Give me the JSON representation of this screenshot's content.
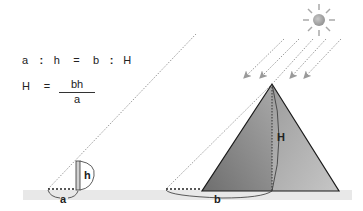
{
  "formulas": {
    "ratio": {
      "a": "a",
      "colon1": ":",
      "h": "h",
      "eq": "=",
      "b": "b",
      "colon2": ":",
      "H": "H"
    },
    "solution": {
      "lhs": "H",
      "eq": "=",
      "numerator": "bh",
      "denominator": "a"
    }
  },
  "labels": {
    "stick_height": "h",
    "stick_shadow": "a",
    "pyramid_height": "H",
    "pyramid_shadow": "b"
  },
  "colors": {
    "ground": "#e6e6e6",
    "pyramid_left_face": "#8a8a8a",
    "pyramid_right_face": "#b5b5b5",
    "sun": "#a0a0a0",
    "rays": "#9a9a9a",
    "ink": "#222222"
  }
}
